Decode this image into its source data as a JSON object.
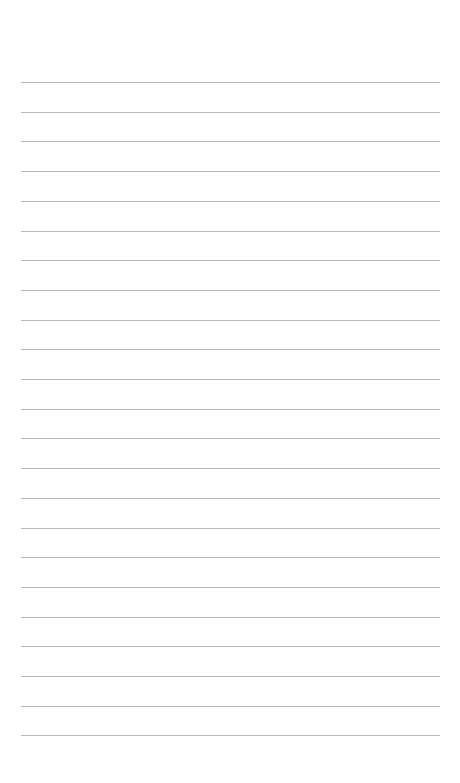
{
  "page": {
    "type": "blank-lined-paper",
    "background_color": "#ffffff",
    "rule_color": "#b9b9b9",
    "rule_count": 23,
    "first_rule_y": 82,
    "rule_spacing": 29.7,
    "rule_left": 21,
    "rule_right": 440,
    "text_lines": []
  }
}
